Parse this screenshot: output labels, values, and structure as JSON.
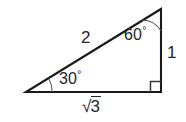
{
  "figure": {
    "kind": "geometry-diagram",
    "background_color": "#ffffff",
    "line_color": "#1a1a1a",
    "arc_color": "#5a5a5a",
    "text_color": "#262626",
    "width": 186,
    "height": 122,
    "vertices": {
      "left": {
        "x": 26,
        "y": 92
      },
      "bottom_right": {
        "x": 161,
        "y": 92
      },
      "top_right": {
        "x": 161,
        "y": 9
      }
    },
    "labels": {
      "hypotenuse": "2",
      "vertical_leg": "1",
      "base_leg_radical": "√",
      "base_leg_radicand": "3",
      "base_leg_full": "√3",
      "angle_top": "60",
      "angle_top_unit": "°",
      "angle_top_full": "60°",
      "angle_left": "30",
      "angle_left_unit": "°",
      "angle_left_full": "30°",
      "right_angle_marker": "right-angle-square"
    }
  }
}
